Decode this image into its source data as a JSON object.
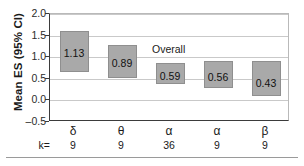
{
  "chart_data": {
    "type": "bar",
    "title": "",
    "xlabel": "",
    "ylabel": "Mean ES (95% CI)",
    "ylim": [
      -0.5,
      2.0
    ],
    "yticks": [
      "2.0",
      "1.5",
      "1.0",
      "0.5",
      "0.0",
      "–0.5"
    ],
    "ytick_values": [
      2.0,
      1.5,
      1.0,
      0.5,
      0.0,
      -0.5
    ],
    "grid": true,
    "legend": "none",
    "annotations": [
      {
        "text": "Overall",
        "x_category": "α",
        "y": 1.2
      }
    ],
    "row_header": "k=",
    "categories": [
      "δ",
      "θ",
      "α",
      "α",
      "β"
    ],
    "k_values": [
      "9",
      "9",
      "36",
      "9",
      "9"
    ],
    "values": [
      1.13,
      0.89,
      0.59,
      0.56,
      0.43
    ],
    "value_labels": [
      "1.13",
      "0.89",
      "0.59",
      "0.56",
      "0.43"
    ],
    "ci_low": [
      0.65,
      0.52,
      0.37,
      0.28,
      0.09
    ],
    "ci_high": [
      1.6,
      1.29,
      0.86,
      0.92,
      0.92
    ],
    "bar_color": "#a9a9a9",
    "bar_edge_color": "#8f8f8f",
    "axis_color": "#3b3b3b",
    "grid_color": "#c9c9c9",
    "bars": [
      {
        "category": "δ",
        "k": "9",
        "label": "1.13",
        "value": 1.13,
        "low": 0.65,
        "high": 1.6
      },
      {
        "category": "θ",
        "k": "9",
        "label": "0.89",
        "value": 0.89,
        "low": 0.52,
        "high": 1.29
      },
      {
        "category": "α",
        "k": "36",
        "label": "0.59",
        "value": 0.59,
        "low": 0.37,
        "high": 0.86
      },
      {
        "category": "α",
        "k": "9",
        "label": "0.56",
        "value": 0.56,
        "low": 0.28,
        "high": 0.92
      },
      {
        "category": "β",
        "k": "9",
        "label": "0.43",
        "value": 0.43,
        "low": 0.09,
        "high": 0.92
      }
    ]
  }
}
